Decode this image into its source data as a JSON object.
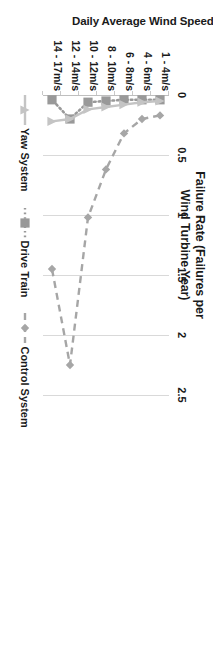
{
  "chart_data": {
    "type": "line",
    "title": "Failure Rate (Failures per Wind Turbine Year)",
    "xlabel": "Failure Rate (Failures per Wind Turbine Year)",
    "ylabel": "Daily Average Wind Speed Range at Hub Height (m/s)",
    "orientation": "horizontal-rotated-90",
    "grid": true,
    "legend_position": "bottom",
    "xlim": [
      0,
      2.5
    ],
    "xticks": [
      "0",
      "0.5",
      "1",
      "1.5",
      "2",
      "2.5"
    ],
    "xtick_values": [
      0,
      0.5,
      1,
      1.5,
      2,
      2.5
    ],
    "categories": [
      "1 - 4m/s",
      "4 - 6m/s",
      "6 - 8m/s",
      "8 - 10m/s",
      "10 - 12m/s",
      "12 - 14m/s",
      "14 - 17m/s"
    ],
    "series": [
      {
        "name": "Control System",
        "marker": "diamond",
        "line_style": "dashed",
        "color": "#a6a6a6",
        "values": [
          0.17,
          0.2,
          0.32,
          0.62,
          1.02,
          2.25,
          1.45
        ]
      },
      {
        "name": "Drive Train",
        "marker": "square",
        "line_style": "dotted",
        "color": "#999999",
        "values": [
          0.04,
          0.04,
          0.04,
          0.05,
          0.06,
          0.2,
          0.04
        ]
      },
      {
        "name": "Yaw System",
        "marker": "triangle",
        "line_style": "solid",
        "color": "#c4c4c4",
        "values": [
          0.05,
          0.06,
          0.08,
          0.1,
          0.12,
          0.2,
          0.22
        ]
      }
    ]
  },
  "chart": {
    "title_line1": "Failure Rate (Failures per",
    "title_line2": "Wind Turbine Year)",
    "category_axis_title": "Daily Average Wind Speed Range at Hub Height (m/s)"
  },
  "legend": {
    "items": [
      {
        "label": "Yaw System"
      },
      {
        "label": "Drive Train"
      },
      {
        "label": "Control System"
      }
    ]
  },
  "colors": {
    "control_system": "#a6a6a6",
    "drive_train": "#999999",
    "yaw_system": "#c4c4c4",
    "gridline": "#d9d9d9",
    "text": "#1a1a1a"
  }
}
